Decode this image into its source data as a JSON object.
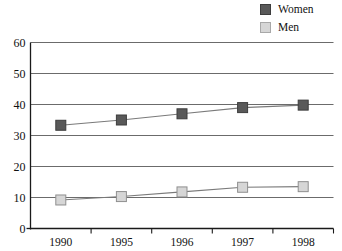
{
  "legend": {
    "position": "top-right",
    "items": [
      {
        "label": "Women",
        "color": "#595959",
        "border": "#3d3d3d",
        "icon": "legend-swatch-square"
      },
      {
        "label": "Men",
        "color": "#d6d6d6",
        "border": "#a8a8a8",
        "icon": "legend-swatch-square"
      }
    ]
  },
  "chart_data": {
    "type": "line",
    "title": "",
    "subtitle": "",
    "xlabel": "",
    "ylabel": "",
    "categories": [
      "1990",
      "1995",
      "1996",
      "1997",
      "1998"
    ],
    "series": [
      {
        "name": "Women",
        "values": [
          33.3,
          35.0,
          37.0,
          39.0,
          39.8
        ],
        "color": "#595959",
        "marker": "square"
      },
      {
        "name": "Men",
        "values": [
          9.2,
          10.3,
          11.8,
          13.3,
          13.5
        ],
        "color": "#d6d6d6",
        "marker": "square"
      }
    ],
    "ylim": [
      0,
      60
    ],
    "yticks": [
      0,
      10,
      20,
      30,
      40,
      50,
      60
    ],
    "ytick_labels": [
      "0",
      "10",
      "20",
      "30",
      "40",
      "50",
      "60"
    ],
    "grid": true,
    "grid_axis": "y",
    "legend_position": "top-right"
  },
  "colors": {
    "grid": "#6b6b6b",
    "axis": "#1a1a1a",
    "women": "#595959",
    "men": "#d6d6d6",
    "line": "#7a7a7a",
    "background": "#ffffff"
  }
}
